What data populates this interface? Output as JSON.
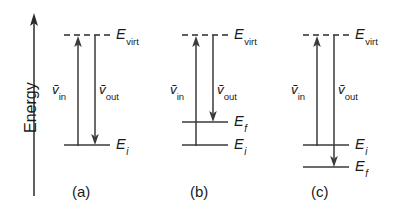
{
  "figure": {
    "axis": {
      "label": "Energy",
      "direction": "up",
      "name": "energy-axis"
    },
    "labels": {
      "E": "E",
      "virt": "virt",
      "i": "i",
      "f": "f",
      "nu": "ṽ",
      "in": "in",
      "out": "out"
    },
    "panels": [
      {
        "caption": "(a)",
        "process": "Rayleigh scattering",
        "levels": [
          {
            "name": "virtual-level",
            "label_base": "E",
            "label_sub": "virt",
            "style": "dashed"
          },
          {
            "name": "initial-level",
            "label_base": "E",
            "label_sub": "i",
            "style": "solid"
          }
        ],
        "arrows": [
          {
            "name": "incident-photon-arrow",
            "label_base": "ṽ",
            "label_sub": "in",
            "direction": "up"
          },
          {
            "name": "scattered-photon-arrow",
            "label_base": "ṽ",
            "label_sub": "out",
            "direction": "down"
          }
        ]
      },
      {
        "caption": "(b)",
        "process": "Stokes scattering",
        "levels": [
          {
            "name": "virtual-level",
            "label_base": "E",
            "label_sub": "virt",
            "style": "dashed"
          },
          {
            "name": "final-level",
            "label_base": "E",
            "label_sub": "f",
            "style": "solid"
          },
          {
            "name": "initial-level",
            "label_base": "E",
            "label_sub": "i",
            "style": "solid"
          }
        ],
        "arrows": [
          {
            "name": "incident-photon-arrow",
            "label_base": "ṽ",
            "label_sub": "in",
            "direction": "up"
          },
          {
            "name": "scattered-photon-arrow",
            "label_base": "ṽ",
            "label_sub": "out",
            "direction": "down"
          }
        ]
      },
      {
        "caption": "(c)",
        "process": "anti-Stokes scattering",
        "levels": [
          {
            "name": "virtual-level",
            "label_base": "E",
            "label_sub": "virt",
            "style": "dashed"
          },
          {
            "name": "initial-level",
            "label_base": "E",
            "label_sub": "i",
            "style": "solid"
          },
          {
            "name": "final-level",
            "label_base": "E",
            "label_sub": "f",
            "style": "solid"
          }
        ],
        "arrows": [
          {
            "name": "incident-photon-arrow",
            "label_base": "ṽ",
            "label_sub": "in",
            "direction": "up"
          },
          {
            "name": "scattered-photon-arrow",
            "label_base": "ṽ",
            "label_sub": "out",
            "direction": "down"
          }
        ]
      }
    ],
    "colors": {
      "line": "#3a3a3a",
      "text": "#1a1a1a",
      "background": "#ffffff"
    }
  }
}
